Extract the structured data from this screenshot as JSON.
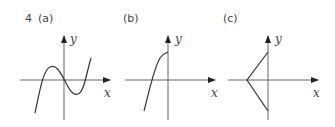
{
  "question_number": "4",
  "panels": [
    {
      "id": "a",
      "label": "(a)",
      "x_axis_label": "x",
      "y_axis_label": "y",
      "description": "cubic curve crossing x-axis three times, local max left of origin, local min right of origin"
    },
    {
      "id": "b",
      "label": "(b)",
      "x_axis_label": "x",
      "y_axis_label": "y",
      "description": "concave-down increasing curve ending at positive y-intercept, crossing negative x-axis"
    },
    {
      "id": "c",
      "label": "(c)",
      "x_axis_label": "x",
      "y_axis_label": "y",
      "description": "two line segments forming a '<' shape with vertex on negative x-axis, endpoints on positive and negative y-axis"
    }
  ],
  "colors": {
    "line": "#333333",
    "text": "#444444"
  }
}
